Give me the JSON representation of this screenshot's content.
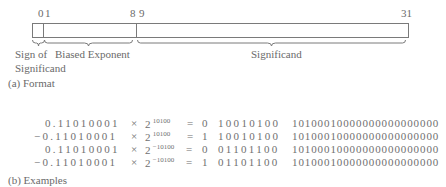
{
  "format": {
    "bit_labels": {
      "b0": "0",
      "b1": "1",
      "b8": "8",
      "b9": "9",
      "b31": "31"
    },
    "fields": {
      "sign_line1": "Sign of",
      "sign_line2": "Significand",
      "exponent": "Biased Exponent",
      "significand": "Significand"
    },
    "caption": "(a) Format"
  },
  "examples": {
    "caption": "(b) Examples",
    "rows": [
      {
        "mantissa": "0.11010001",
        "times": "×",
        "base": "2",
        "exp": "10100",
        "eq": "=",
        "sign": "0",
        "exponent": "10010100",
        "significand": "10100010000000000000000"
      },
      {
        "mantissa": "−0.11010001",
        "times": "×",
        "base": "2",
        "exp": "10100",
        "eq": "=",
        "sign": "1",
        "exponent": "10010100",
        "significand": "10100010000000000000000"
      },
      {
        "mantissa": "0.11010001",
        "times": "×",
        "base": "2",
        "exp": "−10100",
        "eq": "=",
        "sign": "0",
        "exponent": "01101100",
        "significand": "10100010000000000000000"
      },
      {
        "mantissa": "−0.11010001",
        "times": "×",
        "base": "2",
        "exp": "−10100",
        "eq": "=",
        "sign": "1",
        "exponent": "01101100",
        "significand": "10100010000000000000000"
      }
    ]
  },
  "colors": {
    "line": "#7a7a7a",
    "text": "#6a6a6a"
  }
}
